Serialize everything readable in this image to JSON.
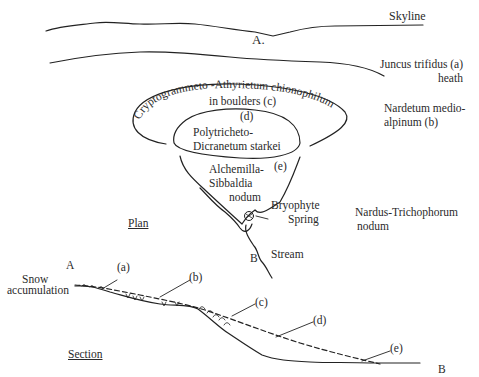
{
  "figure": {
    "top_caption_partial": "",
    "plan": {
      "title": "Plan",
      "point_a": "A.",
      "point_b": "B",
      "labels": {
        "skyline": "Skyline",
        "juncus_line1": "Juncus trifidus (a)",
        "juncus_line2": "heath",
        "nardetum_line1": "Nardetum medio-",
        "nardetum_line2": "alpinum (b)",
        "crypto_arc": "Cryptogrammeto -Athyrietum chionophilum",
        "crypto_inner": "in  boulders (c)",
        "d_marker": "(d)",
        "polytricheto_line1": "Polytricheto-",
        "polytricheto_line2": "Dicranetum starkei",
        "e_marker": "(e)",
        "alchemilla_line1": "Alchemilla-",
        "alchemilla_line2": "Sibbaldia",
        "alchemilla_line3": "nodum",
        "bryophyte_line1": "Bryophyte",
        "bryophyte_line2": "Spring",
        "stream": "Stream",
        "nardus_line1": "Nardus-Trichophorum",
        "nardus_line2": "nodum"
      }
    },
    "section": {
      "title": "Section",
      "point_a": "A",
      "point_b": "B",
      "snow_line1": "Snow",
      "snow_line2": "accumulation",
      "markers": [
        "(a)",
        "(b)",
        "(c)",
        "(d)",
        "(e)"
      ]
    },
    "colors": {
      "ink": "#222222",
      "background": "#ffffff"
    }
  }
}
